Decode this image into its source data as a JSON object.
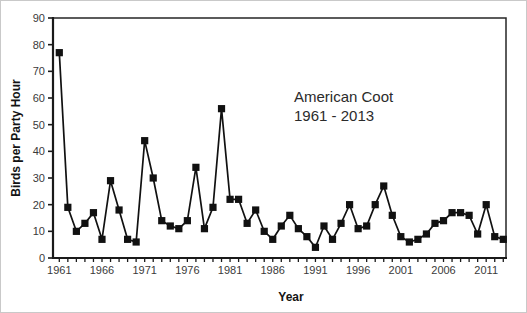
{
  "figure": {
    "annotation": {
      "line1": "American Coot",
      "line2": "1961 - 2013"
    }
  },
  "chart_data": {
    "type": "line",
    "title": "",
    "annotation": [
      "American Coot",
      "1961 - 2013"
    ],
    "xlabel": "Year",
    "ylabel": "Birds per Party Hour",
    "x": [
      1961,
      1962,
      1963,
      1964,
      1965,
      1966,
      1967,
      1968,
      1969,
      1970,
      1971,
      1972,
      1973,
      1974,
      1975,
      1976,
      1977,
      1978,
      1979,
      1980,
      1981,
      1982,
      1983,
      1984,
      1985,
      1986,
      1987,
      1988,
      1989,
      1990,
      1991,
      1992,
      1993,
      1994,
      1995,
      1996,
      1997,
      1998,
      1999,
      2000,
      2001,
      2002,
      2003,
      2004,
      2005,
      2006,
      2007,
      2008,
      2009,
      2010,
      2011,
      2012,
      2013
    ],
    "values": [
      77,
      19,
      10,
      13,
      17,
      7,
      29,
      18,
      7,
      6,
      44,
      30,
      14,
      12,
      11,
      14,
      34,
      11,
      19,
      56,
      22,
      22,
      13,
      18,
      10,
      7,
      12,
      16,
      11,
      8,
      4,
      12,
      7,
      13,
      20,
      11,
      12,
      20,
      27,
      16,
      8,
      6,
      7,
      9,
      13,
      14,
      17,
      17,
      16,
      9,
      20,
      8,
      7
    ],
    "xlim": [
      1960,
      2013.5
    ],
    "ylim": [
      0,
      90
    ],
    "y_ticks": [
      0,
      10,
      20,
      30,
      40,
      50,
      60,
      70,
      80,
      90
    ],
    "x_tick_labels": [
      1961,
      1966,
      1971,
      1976,
      1981,
      1986,
      1991,
      1996,
      2001,
      2006,
      2011
    ],
    "x_minor_tick_step": 1,
    "grid": false,
    "legend": "none",
    "line_color": "#111111",
    "marker": "square",
    "marker_color": "#111111",
    "axis_color": "#1a1a1a",
    "tick_label_color": "#3a3a3a"
  }
}
